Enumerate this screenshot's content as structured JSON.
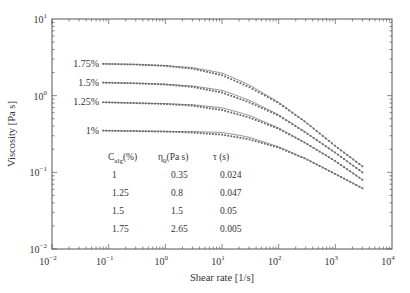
{
  "chart_data": {
    "type": "line",
    "title": "",
    "xlabel": "Shear rate [1/s]",
    "ylabel": "Viscosity [Pa s]",
    "xscale": "log",
    "yscale": "log",
    "xlim": [
      0.01,
      10000
    ],
    "ylim": [
      0.01,
      10
    ],
    "x_ticks": [
      "10^-2",
      "10^-1",
      "10^0",
      "10^1",
      "10^2",
      "10^3",
      "10^4"
    ],
    "y_ticks": [
      "10^-2",
      "10^-1",
      "10^0",
      "10^1"
    ],
    "grid": false,
    "legend": "inline labels at left of each curve",
    "series": [
      {
        "name": "1.75%",
        "eta0": 2.65,
        "tau": 0.005,
        "x": [
          0.08,
          0.3,
          1,
          3,
          10,
          30,
          100,
          300,
          1000,
          3000
        ],
        "values": [
          2.6,
          2.55,
          2.45,
          2.25,
          1.85,
          1.3,
          0.8,
          0.45,
          0.22,
          0.12
        ]
      },
      {
        "name": "1.5%",
        "eta0": 1.5,
        "tau": 0.05,
        "x": [
          0.08,
          0.3,
          1,
          3,
          10,
          30,
          100,
          300,
          1000,
          3000
        ],
        "values": [
          1.48,
          1.45,
          1.4,
          1.3,
          1.1,
          0.82,
          0.55,
          0.33,
          0.18,
          0.1
        ]
      },
      {
        "name": "1.25%",
        "eta0": 0.8,
        "tau": 0.047,
        "x": [
          0.08,
          0.3,
          1,
          3,
          10,
          30,
          100,
          300,
          1000,
          3000
        ],
        "values": [
          0.82,
          0.8,
          0.78,
          0.74,
          0.65,
          0.52,
          0.37,
          0.24,
          0.14,
          0.08
        ]
      },
      {
        "name": "1%",
        "eta0": 0.35,
        "tau": 0.024,
        "x": [
          0.08,
          0.3,
          1,
          3,
          10,
          30,
          100,
          300,
          1000,
          3000
        ],
        "values": [
          0.35,
          0.345,
          0.34,
          0.33,
          0.31,
          0.27,
          0.21,
          0.15,
          0.095,
          0.062
        ]
      }
    ],
    "annotations": {
      "table": {
        "headers": [
          "C_alg(%)",
          "η0(Pa s)",
          "τ (s)"
        ],
        "rows": [
          [
            "1",
            "0.35",
            "0.024"
          ],
          [
            "1.25",
            "0.8",
            "0.047"
          ],
          [
            "1.5",
            "1.5",
            "0.05"
          ],
          [
            "1.75",
            "2.65",
            "0.005"
          ]
        ]
      }
    }
  },
  "axes": {
    "xlabel": "Shear rate [1/s]",
    "ylabel": "Viscosity [Pa s]",
    "x_ticks": [
      {
        "base": "10",
        "exp": "−2"
      },
      {
        "base": "10",
        "exp": "−1"
      },
      {
        "base": "10",
        "exp": "0"
      },
      {
        "base": "10",
        "exp": "1"
      },
      {
        "base": "10",
        "exp": "2"
      },
      {
        "base": "10",
        "exp": "3"
      },
      {
        "base": "10",
        "exp": "4"
      }
    ],
    "y_ticks": [
      {
        "base": "10",
        "exp": "−2"
      },
      {
        "base": "10",
        "exp": "−1"
      },
      {
        "base": "10",
        "exp": "0"
      },
      {
        "base": "10",
        "exp": "1"
      }
    ]
  },
  "table": {
    "header_c": "C",
    "header_c_sub": "alg",
    "header_c_unit": "(%)",
    "header_eta": "η",
    "header_eta_sub": "0",
    "header_eta_unit": "(Pa s)",
    "header_tau": "τ (s)",
    "rows": [
      {
        "c": "1",
        "eta": "0.35",
        "tau": "0.024"
      },
      {
        "c": "1.25",
        "eta": "0.8",
        "tau": "0.047"
      },
      {
        "c": "1.5",
        "eta": "1.5",
        "tau": "0.05"
      },
      {
        "c": "1.75",
        "eta": "2.65",
        "tau": "0.005"
      }
    ]
  },
  "colors": {
    "axis": "#555555",
    "fit_line": "#888888",
    "marker": "#666666",
    "text": "#333333"
  }
}
